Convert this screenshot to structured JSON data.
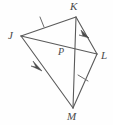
{
  "figure": {
    "type": "geometry-diagram",
    "stroke_color": "#5a5a5a",
    "label_color": "#4a4a4a",
    "background_color": "#fefefe",
    "vertices": [
      {
        "name": "J",
        "label": "J",
        "x": 21,
        "y": 36,
        "label_x": 8,
        "label_y": 31
      },
      {
        "name": "K",
        "label": "K",
        "x": 76,
        "y": 17,
        "label_x": 71,
        "label_y": 2
      },
      {
        "name": "L",
        "label": "L",
        "x": 97,
        "y": 54,
        "label_x": 101,
        "label_y": 51
      },
      {
        "name": "M",
        "label": "M",
        "x": 73,
        "y": 108,
        "label_x": 68,
        "label_y": 111
      },
      {
        "name": "P",
        "label": "P",
        "x": 73,
        "y": 52,
        "label_x": 59,
        "label_y": 48
      }
    ],
    "segments": [
      {
        "name": "JK",
        "from": "J",
        "to": "K",
        "x1": 21,
        "y1": 36,
        "x2": 76,
        "y2": 17,
        "marks": "single-tick"
      },
      {
        "name": "KL",
        "from": "K",
        "to": "L",
        "x1": 76,
        "y1": 17,
        "x2": 97,
        "y2": 54,
        "marks": "single-arrow"
      },
      {
        "name": "LM",
        "from": "L",
        "to": "M",
        "x1": 97,
        "y1": 54,
        "x2": 73,
        "y2": 108,
        "marks": "single-tick"
      },
      {
        "name": "MJ",
        "from": "J",
        "to": "M",
        "x1": 21,
        "y1": 36,
        "x2": 73,
        "y2": 108,
        "marks": "single-arrow"
      },
      {
        "name": "JL",
        "from": "J",
        "to": "L",
        "x1": 21,
        "y1": 36,
        "x2": 97,
        "y2": 54,
        "marks": "none"
      },
      {
        "name": "KM",
        "from": "K",
        "to": "M",
        "x1": 76,
        "y1": 17,
        "x2": 73,
        "y2": 108,
        "marks": "none"
      }
    ],
    "tick_marks": [
      {
        "name": "tick-JK",
        "on": "JK",
        "x": 42,
        "y": 22
      },
      {
        "name": "tick-LM",
        "on": "LM",
        "x": 83,
        "y": 78
      }
    ],
    "arrow_marks": [
      {
        "name": "arrow-KL",
        "on": "KL",
        "x": 86,
        "y": 33,
        "direction": "toward-L"
      },
      {
        "name": "arrow-JM",
        "on": "MJ",
        "x": 38,
        "y": 66,
        "direction": "toward-M"
      }
    ]
  }
}
